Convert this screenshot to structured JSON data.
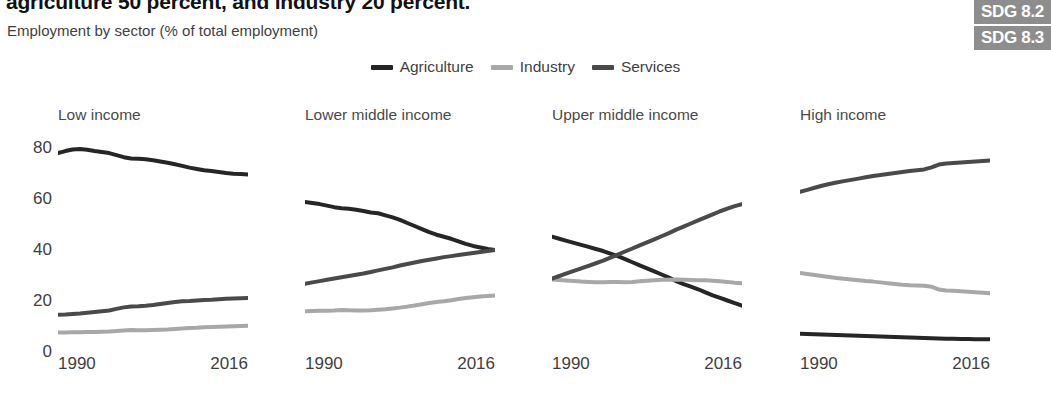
{
  "header": {
    "headline": "agriculture 50 percent, and industry 20 percent.",
    "subtitle": "Employment by sector (% of total employment)"
  },
  "badges": [
    {
      "label": "SDG 8.2"
    },
    {
      "label": "SDG 8.3"
    }
  ],
  "legend": [
    {
      "label": "Agriculture",
      "color": "#262626"
    },
    {
      "label": "Industry",
      "color": "#a8a8a8"
    },
    {
      "label": "Services",
      "color": "#4a4a4a"
    }
  ],
  "axis": {
    "y_ticks": [
      "80",
      "60",
      "40",
      "20",
      "0"
    ],
    "x_start": "1990",
    "x_end": "2016"
  },
  "chart_data": {
    "type": "line",
    "title": "Employment by sector (% of total employment)",
    "xlabel": "",
    "ylabel": "% of total employment",
    "ylim": [
      0,
      85
    ],
    "xlim": [
      1990,
      2016
    ],
    "grid": false,
    "legend_position": "top-center",
    "x": [
      1990,
      1991,
      1992,
      1993,
      1994,
      1995,
      1996,
      1997,
      1998,
      1999,
      2000,
      2001,
      2002,
      2003,
      2004,
      2005,
      2006,
      2007,
      2008,
      2009,
      2010,
      2011,
      2012,
      2013,
      2014,
      2015,
      2016
    ],
    "panels": [
      {
        "name": "Low income",
        "series": [
          {
            "name": "Agriculture",
            "color": "#262626",
            "values": [
              78.0,
              78.8,
              79.4,
              79.6,
              79.3,
              78.8,
              78.4,
              78.0,
              77.2,
              76.4,
              75.9,
              75.8,
              75.6,
              75.2,
              74.7,
              74.2,
              73.6,
              73.0,
              72.3,
              71.8,
              71.3,
              71.0,
              70.6,
              70.2,
              69.9,
              69.8,
              69.6
            ]
          },
          {
            "name": "Industry",
            "color": "#a8a8a8",
            "values": [
              7.6,
              7.6,
              7.7,
              7.7,
              7.8,
              7.8,
              7.9,
              8.0,
              8.2,
              8.4,
              8.6,
              8.5,
              8.5,
              8.6,
              8.7,
              8.8,
              9.0,
              9.2,
              9.4,
              9.5,
              9.7,
              9.8,
              9.9,
              10.0,
              10.1,
              10.2,
              10.3
            ]
          },
          {
            "name": "Services",
            "color": "#4a4a4a",
            "values": [
              14.6,
              14.7,
              14.9,
              15.1,
              15.4,
              15.7,
              16.0,
              16.3,
              16.9,
              17.5,
              17.8,
              17.9,
              18.1,
              18.4,
              18.8,
              19.2,
              19.6,
              19.9,
              20.0,
              20.2,
              20.4,
              20.5,
              20.7,
              20.9,
              21.0,
              21.1,
              21.2
            ]
          }
        ]
      },
      {
        "name": "Lower middle income",
        "series": [
          {
            "name": "Agriculture",
            "color": "#262626",
            "values": [
              58.8,
              58.4,
              58.0,
              57.4,
              56.8,
              56.4,
              56.2,
              55.8,
              55.3,
              54.7,
              54.4,
              53.6,
              52.8,
              51.8,
              50.6,
              49.4,
              48.2,
              47.0,
              46.0,
              45.2,
              44.4,
              43.4,
              42.4,
              41.6,
              41.0,
              40.4,
              40.0
            ]
          },
          {
            "name": "Industry",
            "color": "#a8a8a8",
            "values": [
              16.0,
              16.1,
              16.2,
              16.2,
              16.3,
              16.5,
              16.4,
              16.3,
              16.3,
              16.4,
              16.6,
              16.8,
              17.1,
              17.4,
              17.8,
              18.2,
              18.7,
              19.2,
              19.6,
              19.9,
              20.3,
              20.8,
              21.2,
              21.5,
              21.8,
              22.0,
              22.2
            ]
          },
          {
            "name": "Services",
            "color": "#4a4a4a",
            "values": [
              26.8,
              27.3,
              27.8,
              28.3,
              28.8,
              29.3,
              29.8,
              30.3,
              30.8,
              31.4,
              32.0,
              32.6,
              33.2,
              33.9,
              34.5,
              35.1,
              35.7,
              36.2,
              36.7,
              37.2,
              37.6,
              38.0,
              38.4,
              38.8,
              39.2,
              39.6,
              40.0
            ]
          }
        ]
      },
      {
        "name": "Upper middle income",
        "series": [
          {
            "name": "Agriculture",
            "color": "#262626",
            "values": [
              45.2,
              44.4,
              43.6,
              42.8,
              42.0,
              41.2,
              40.4,
              39.6,
              38.6,
              37.6,
              36.4,
              35.2,
              34.0,
              32.8,
              31.6,
              30.4,
              29.2,
              27.8,
              26.6,
              25.6,
              24.6,
              23.4,
              22.2,
              21.2,
              20.2,
              19.2,
              18.2
            ]
          },
          {
            "name": "Industry",
            "color": "#a8a8a8",
            "values": [
              28.4,
              28.2,
              28.0,
              27.8,
              27.6,
              27.5,
              27.4,
              27.4,
              27.5,
              27.5,
              27.4,
              27.5,
              27.7,
              27.9,
              28.1,
              28.3,
              28.3,
              28.4,
              28.3,
              28.2,
              28.1,
              28.1,
              27.9,
              27.7,
              27.5,
              27.2,
              27.0
            ]
          },
          {
            "name": "Services",
            "color": "#4a4a4a",
            "values": [
              28.8,
              29.8,
              30.8,
              31.8,
              32.8,
              33.8,
              34.8,
              35.8,
              37.0,
              38.2,
              39.4,
              40.6,
              41.8,
              43.0,
              44.2,
              45.4,
              46.6,
              48.0,
              49.2,
              50.4,
              51.6,
              52.8,
              54.0,
              55.2,
              56.2,
              57.2,
              58.0
            ]
          }
        ]
      },
      {
        "name": "High income",
        "series": [
          {
            "name": "Agriculture",
            "color": "#262626",
            "values": [
              7.2,
              7.1,
              7.0,
              6.9,
              6.8,
              6.7,
              6.6,
              6.5,
              6.4,
              6.3,
              6.2,
              6.1,
              6.0,
              5.9,
              5.8,
              5.7,
              5.6,
              5.5,
              5.4,
              5.3,
              5.2,
              5.2,
              5.1,
              5.1,
              5.0,
              5.0,
              5.0
            ]
          },
          {
            "name": "Industry",
            "color": "#a8a8a8",
            "values": [
              31.0,
              30.6,
              30.2,
              29.8,
              29.4,
              29.0,
              28.7,
              28.4,
              28.1,
              27.8,
              27.6,
              27.3,
              27.0,
              26.7,
              26.4,
              26.2,
              26.1,
              26.0,
              25.6,
              24.5,
              24.1,
              24.0,
              23.8,
              23.6,
              23.4,
              23.2,
              23.0
            ]
          },
          {
            "name": "Services",
            "color": "#4a4a4a",
            "values": [
              62.8,
              63.6,
              64.4,
              65.2,
              65.9,
              66.5,
              67.0,
              67.5,
              68.0,
              68.5,
              69.0,
              69.4,
              69.8,
              70.2,
              70.6,
              71.0,
              71.3,
              71.6,
              72.4,
              73.5,
              73.9,
              74.1,
              74.3,
              74.5,
              74.7,
              74.9,
              75.1
            ]
          }
        ]
      }
    ]
  }
}
